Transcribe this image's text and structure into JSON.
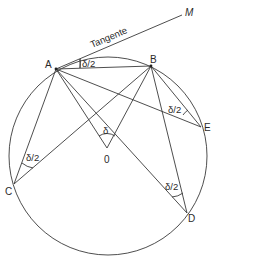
{
  "diagram": {
    "circle": {
      "cx": 108,
      "cy": 156,
      "r": 99
    },
    "points": {
      "A": {
        "label": "A",
        "x": 56,
        "y": 69
      },
      "B": {
        "label": "B",
        "x": 151,
        "y": 66
      },
      "C": {
        "label": "C",
        "x": 14,
        "y": 184
      },
      "D": {
        "label": "D",
        "x": 187,
        "y": 213
      },
      "E": {
        "label": "E",
        "x": 201,
        "y": 127
      },
      "O": {
        "label": "0",
        "x": 107,
        "y": 148
      },
      "M": {
        "label": "M",
        "x": 184,
        "y": 13
      }
    },
    "tangent_label": "Tangente",
    "angle_labels": {
      "tangent_chord": "δ/2",
      "central": "δ",
      "at_C": "δ/2",
      "at_D": "δ/2",
      "at_E": "δ/2"
    }
  }
}
